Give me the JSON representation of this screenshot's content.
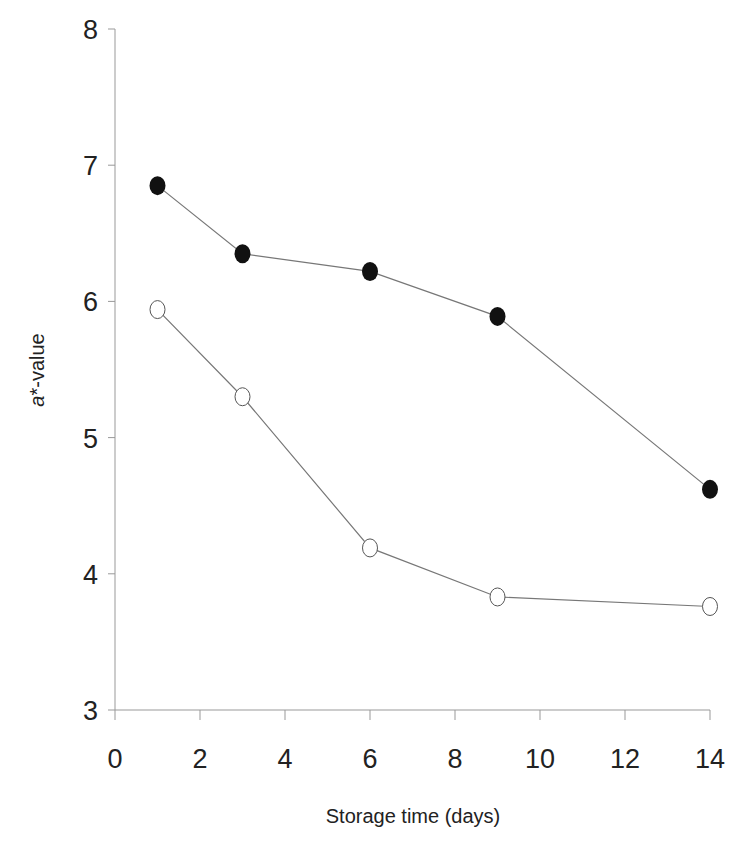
{
  "chart_data": {
    "type": "line",
    "title": "",
    "xlabel": "Storage time (days)",
    "ylabel_italic": "a",
    "ylabel_rest": "*-value",
    "ylabel": "a*-value",
    "xlim": [
      0,
      14
    ],
    "ylim": [
      3,
      8
    ],
    "xticks": [
      0,
      2,
      4,
      6,
      8,
      10,
      12,
      14
    ],
    "yticks": [
      3,
      4,
      5,
      6,
      7,
      8
    ],
    "grid": false,
    "legend": "none",
    "x": [
      1,
      3,
      6,
      9,
      14
    ],
    "series": [
      {
        "name": "filled circles",
        "marker": "filled-circle",
        "color": "#111111",
        "values": [
          6.85,
          6.35,
          6.22,
          5.89,
          4.62
        ]
      },
      {
        "name": "open circles",
        "marker": "open-circle",
        "color": "#555555",
        "values": [
          5.94,
          5.3,
          4.19,
          3.83,
          3.76
        ]
      }
    ]
  }
}
